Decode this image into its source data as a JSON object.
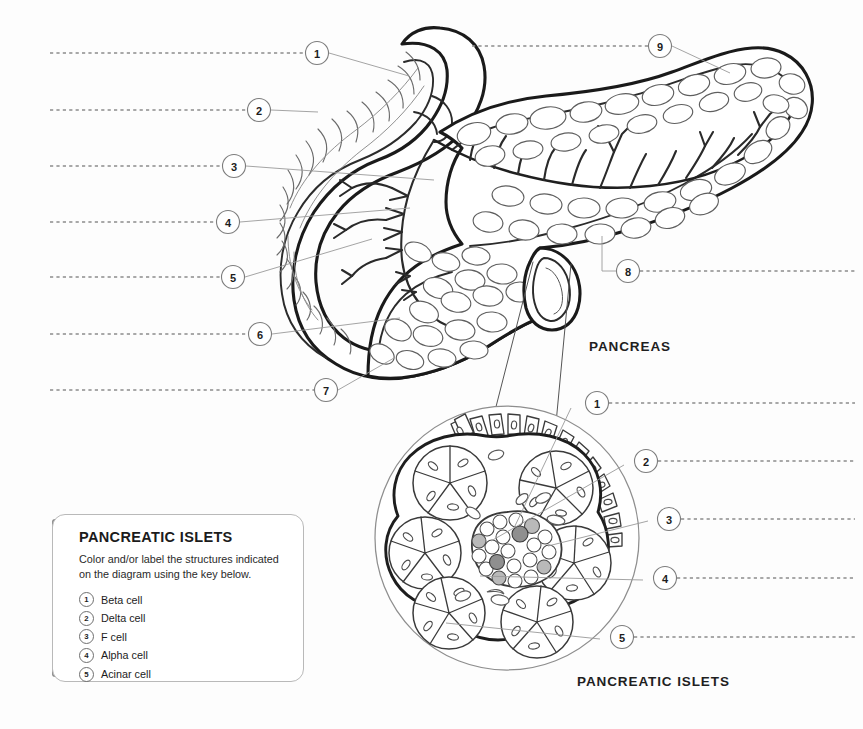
{
  "page": {
    "background_color": "#fdfdfd",
    "ink_color": "#1a1a1a",
    "leader_color": "#8c8c8c"
  },
  "organ_labels": {
    "pancreas": "PANCREAS",
    "islets": "PANCREATIC ISLETS"
  },
  "pancreas_callouts": [
    {
      "n": "1",
      "cx": 317,
      "cy": 53
    },
    {
      "n": "2",
      "cx": 259,
      "cy": 110
    },
    {
      "n": "3",
      "cx": 234,
      "cy": 166
    },
    {
      "n": "4",
      "cx": 228,
      "cy": 222
    },
    {
      "n": "5",
      "cx": 233,
      "cy": 277
    },
    {
      "n": "6",
      "cx": 260,
      "cy": 334
    },
    {
      "n": "7",
      "cx": 326,
      "cy": 390
    },
    {
      "n": "8",
      "cx": 628,
      "cy": 271
    },
    {
      "n": "9",
      "cx": 660,
      "cy": 46
    }
  ],
  "islet_callouts": [
    {
      "n": "1",
      "cx": 597,
      "cy": 403
    },
    {
      "n": "2",
      "cx": 646,
      "cy": 461
    },
    {
      "n": "3",
      "cx": 669,
      "cy": 519
    },
    {
      "n": "4",
      "cx": 665,
      "cy": 578
    },
    {
      "n": "5",
      "cx": 622,
      "cy": 637
    }
  ],
  "legend": {
    "title": "PANCREATIC ISLETS",
    "description": "Color and/or label the structures indicated on the diagram using the key below.",
    "items": [
      {
        "n": "1",
        "label": "Beta cell"
      },
      {
        "n": "2",
        "label": "Delta cell"
      },
      {
        "n": "3",
        "label": "F cell"
      },
      {
        "n": "4",
        "label": "Alpha cell"
      },
      {
        "n": "5",
        "label": "Acinar cell"
      }
    ]
  }
}
